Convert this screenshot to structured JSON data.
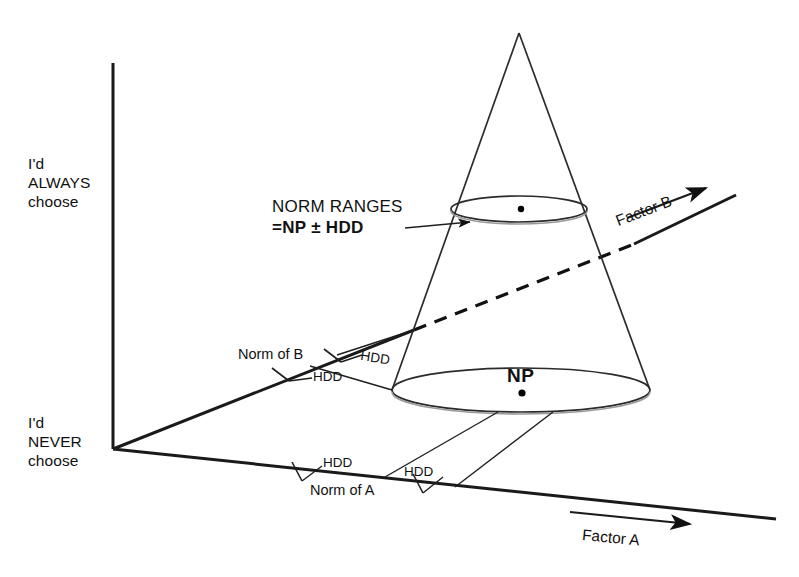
{
  "figure": {
    "kind": "3d-conceptual-diagram",
    "background_color": "#ffffff",
    "line_color": "#111111"
  },
  "vertical_axis": {
    "top_label_line1": "I'd",
    "top_label_line2": "ALWAYS",
    "top_label_line3": "choose",
    "bottom_label_line1": "I'd",
    "bottom_label_line2": "NEVER",
    "bottom_label_line3": "choose"
  },
  "factor_b_axis": {
    "label": "Factor B"
  },
  "factor_a_axis": {
    "label": "Factor A"
  },
  "callout": {
    "line1": "NORM RANGES",
    "line2": "=NP ± HDD"
  },
  "cone": {
    "center_label": "NP",
    "top_ellipse_center_marker": "•",
    "bottom_ellipse_center_marker": "•"
  },
  "b_axis_annotations": {
    "norm_label": "Norm of B",
    "hdd_upper": "HDD",
    "hdd_lower": "HDD"
  },
  "a_axis_annotations": {
    "norm_label": "Norm of A",
    "hdd_left": "HDD",
    "hdd_right": "HDD"
  }
}
